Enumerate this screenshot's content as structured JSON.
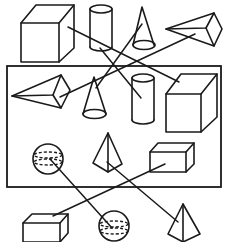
{
  "diagram": {
    "type": "shape-view-matching",
    "stroke_color": "#1a1a1a",
    "background_color": "#ffffff",
    "top_row": [
      {
        "id": "top-cube",
        "shape": "cube"
      },
      {
        "id": "top-cylinder",
        "shape": "cylinder"
      },
      {
        "id": "top-cone",
        "shape": "cone"
      },
      {
        "id": "top-pyramid",
        "shape": "pyramid-lying"
      }
    ],
    "framed_box": [
      {
        "id": "box-pyramid",
        "shape": "pyramid-lying"
      },
      {
        "id": "box-cone",
        "shape": "cone"
      },
      {
        "id": "box-cylinder",
        "shape": "cylinder"
      },
      {
        "id": "box-cube",
        "shape": "cube"
      },
      {
        "id": "box-sphere",
        "shape": "sphere"
      },
      {
        "id": "box-tetra",
        "shape": "triangular-pyramid"
      },
      {
        "id": "box-cuboid",
        "shape": "cuboid"
      }
    ],
    "bottom_row": [
      {
        "id": "bottom-cuboid",
        "shape": "cuboid"
      },
      {
        "id": "bottom-sphere",
        "shape": "sphere"
      },
      {
        "id": "bottom-tetra",
        "shape": "triangular-pyramid"
      }
    ],
    "connections": [
      {
        "from": "top-cube",
        "to": "box-cube"
      },
      {
        "from": "top-cylinder",
        "to": "box-cylinder"
      },
      {
        "from": "top-cone",
        "to": "box-cone"
      },
      {
        "from": "top-pyramid",
        "to": "box-pyramid"
      },
      {
        "from": "box-sphere",
        "to": "bottom-sphere"
      },
      {
        "from": "box-cuboid",
        "to": "bottom-cuboid"
      },
      {
        "from": "box-tetra",
        "to": "bottom-tetra"
      }
    ]
  }
}
